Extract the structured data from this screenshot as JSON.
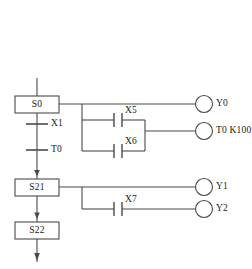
{
  "diagram": {
    "type": "sequential-function-chart",
    "title": "",
    "steps": [
      {
        "id": "S0",
        "label": "S0",
        "x": 15,
        "y": 96,
        "w": 44,
        "h": 17
      },
      {
        "id": "S21",
        "label": "S21",
        "x": 15,
        "y": 179,
        "w": 44,
        "h": 17
      },
      {
        "id": "S22",
        "label": "S22",
        "x": 15,
        "y": 222,
        "w": 44,
        "h": 17
      }
    ],
    "transitions": [
      {
        "id": "X1",
        "label": "X1",
        "x": 46,
        "y": 120
      },
      {
        "id": "T0",
        "label": "T0",
        "x": 46,
        "y": 146
      }
    ],
    "contacts": [
      {
        "id": "X5",
        "label": "X5",
        "x": 124,
        "y": 111
      },
      {
        "id": "X6",
        "label": "X6",
        "x": 124,
        "y": 143
      },
      {
        "id": "X7",
        "label": "X7",
        "x": 124,
        "y": 194
      }
    ],
    "coils": [
      {
        "id": "Y0",
        "label": "Y0",
        "cx": 211,
        "cy": 103
      },
      {
        "id": "T0K",
        "label": "T0 K100",
        "cx": 211,
        "cy": 131
      },
      {
        "id": "Y1",
        "label": "Y1",
        "cx": 211,
        "cy": 181
      },
      {
        "id": "Y2",
        "label": "Y2",
        "cx": 211,
        "cy": 208
      }
    ],
    "colors": {
      "line": "#4a4a4a",
      "text": "#1a1a1a",
      "background": "#ffffff"
    },
    "flow": {
      "entry_arrow": "down",
      "exit_arrow": "down"
    }
  }
}
